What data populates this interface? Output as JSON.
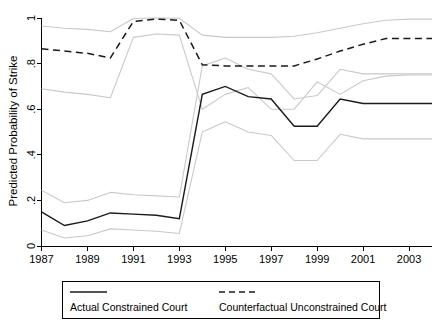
{
  "chart_data": {
    "type": "line",
    "title": "",
    "xlabel": "",
    "ylabel": "Predicted Probability of Strike",
    "xlim": [
      1987,
      2004
    ],
    "ylim": [
      0,
      1
    ],
    "grid": false,
    "legend_position": "bottom",
    "x": [
      1987,
      1988,
      1989,
      1990,
      1991,
      1992,
      1993,
      1994,
      1995,
      1996,
      1997,
      1998,
      1999,
      2000,
      2001,
      2002,
      2003,
      2004
    ],
    "xtick_labels": [
      "1987",
      "1989",
      "1991",
      "1993",
      "1995",
      "1997",
      "1999",
      "2001",
      "2003"
    ],
    "xtick_values": [
      1987,
      1989,
      1991,
      1993,
      1995,
      1997,
      1999,
      2001,
      2003
    ],
    "ytick_labels": [
      "0",
      ".2",
      ".4",
      ".6",
      ".8",
      "1"
    ],
    "ytick_values": [
      0,
      0.2,
      0.4,
      0.6,
      0.8,
      1
    ],
    "series": [
      {
        "name": "Actual Constrained Court",
        "style": "solid",
        "color": "#1a1a1a",
        "values": [
          0.15,
          0.09,
          0.11,
          0.145,
          0.14,
          0.135,
          0.12,
          0.665,
          0.7,
          0.655,
          0.645,
          0.525,
          0.525,
          0.645,
          0.625,
          0.625,
          0.625,
          0.625
        ]
      },
      {
        "name": "Actual Constrained Court CI upper",
        "style": "dotted",
        "color": "#c9c9c9",
        "values": [
          0.245,
          0.19,
          0.2,
          0.235,
          0.225,
          0.22,
          0.215,
          0.79,
          0.825,
          0.775,
          0.755,
          0.645,
          0.66,
          0.775,
          0.755,
          0.755,
          0.755,
          0.755
        ]
      },
      {
        "name": "Actual Constrained Court CI lower",
        "style": "dotted",
        "color": "#c9c9c9",
        "values": [
          0.07,
          0.035,
          0.045,
          0.075,
          0.07,
          0.065,
          0.055,
          0.5,
          0.545,
          0.5,
          0.485,
          0.375,
          0.375,
          0.49,
          0.47,
          0.47,
          0.47,
          0.47
        ]
      },
      {
        "name": "Counterfactual Unconstrained Court",
        "style": "dashed",
        "color": "#1a1a1a",
        "values": [
          0.865,
          0.855,
          0.845,
          0.825,
          0.985,
          0.995,
          0.99,
          0.795,
          0.79,
          0.79,
          0.79,
          0.79,
          0.82,
          0.855,
          0.885,
          0.91,
          0.91,
          0.91
        ]
      },
      {
        "name": "Counterfactual Unconstrained Court CI upper",
        "style": "dotted",
        "color": "#c9c9c9",
        "values": [
          0.965,
          0.955,
          0.95,
          0.94,
          0.998,
          1.0,
          0.999,
          0.925,
          0.915,
          0.915,
          0.915,
          0.92,
          0.935,
          0.955,
          0.975,
          0.99,
          0.995,
          0.995
        ]
      },
      {
        "name": "Counterfactual Unconstrained Court CI lower",
        "style": "dotted",
        "color": "#c9c9c9",
        "values": [
          0.69,
          0.675,
          0.665,
          0.65,
          0.915,
          0.93,
          0.925,
          0.6,
          0.665,
          0.695,
          0.6,
          0.6,
          0.72,
          0.665,
          0.725,
          0.745,
          0.75,
          0.75
        ]
      }
    ]
  },
  "legend": {
    "items": [
      {
        "label": "Actual Constrained Court",
        "style": "solid"
      },
      {
        "label": "Counterfactual Unconstrained Court",
        "style": "dashed"
      }
    ]
  },
  "axes": {
    "y_title": "Predicted Probability of Strike"
  }
}
